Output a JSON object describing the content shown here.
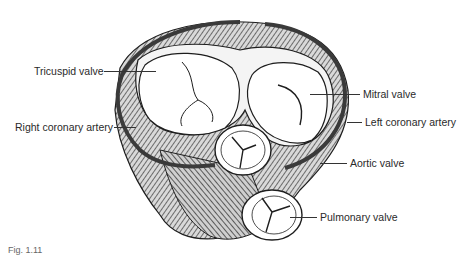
{
  "figure": {
    "figure_number": "Fig. 1.11",
    "labels": {
      "tricuspid": "Tricuspid valve",
      "right_coronary": "Right coronary artery",
      "mitral": "Mitral valve",
      "left_coronary": "Left coronary artery",
      "aortic": "Aortic valve",
      "pulmonary": "Pulmonary valve"
    }
  },
  "colors": {
    "ink": "#1e1e1e",
    "muscle_shade": "#6b6b6b",
    "artery": "#3a3a3a",
    "valve_fill": "#ffffff",
    "background": "#ffffff"
  }
}
